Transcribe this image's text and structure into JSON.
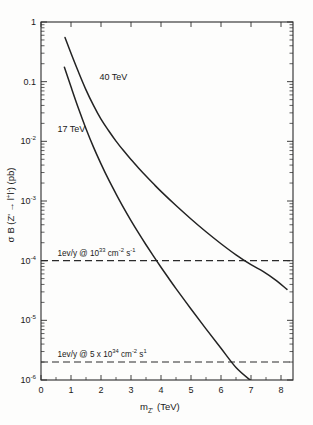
{
  "chart_data": {
    "type": "line",
    "title": "",
    "xlabel": "m_Z' (TeV)",
    "ylabel": "σ B (Z' → l⁺l⁻) (pb)",
    "xlabel_parts": {
      "main": "m",
      "sub": "Z'",
      "units": "(TeV)"
    },
    "ylabel_parts": {
      "sigma": "σ",
      "b": "B (Z'",
      "arrow": "→",
      "leptons": "l",
      "sup_plus": "+",
      "leptons2": "l",
      "sup_minus": "-",
      "close": ") (pb)"
    },
    "xlim": [
      0,
      8.4
    ],
    "ylim": [
      1e-06,
      1
    ],
    "yscale": "log",
    "xscale": "linear",
    "grid": false,
    "legend_position": "inline-annotations",
    "xticks": [
      0,
      1,
      2,
      3,
      4,
      5,
      6,
      7,
      8
    ],
    "xtick_labels": [
      "0",
      "1",
      "2",
      "3",
      "4",
      "5",
      "6",
      "7",
      "8"
    ],
    "yticks": [
      1,
      0.1,
      0.01,
      0.001,
      0.0001,
      1e-05,
      1e-06
    ],
    "ytick_labels": [
      "1",
      "0.1",
      "10⁻²",
      "10⁻³",
      "10⁻⁴",
      "10⁻⁵",
      "10⁻⁶"
    ],
    "ytick_label_parts": [
      {
        "base": "1",
        "exp": ""
      },
      {
        "base": "0.1",
        "exp": ""
      },
      {
        "base": "10",
        "exp": "-2"
      },
      {
        "base": "10",
        "exp": "-3"
      },
      {
        "base": "10",
        "exp": "-4"
      },
      {
        "base": "10",
        "exp": "-5"
      },
      {
        "base": "10",
        "exp": "-6"
      }
    ],
    "series": [
      {
        "name": "40 TeV",
        "label": "40 TeV",
        "label_x": 1.95,
        "label_y": 0.105,
        "points": [
          [
            0.8,
            0.55
          ],
          [
            1.0,
            0.3
          ],
          [
            1.25,
            0.145
          ],
          [
            1.5,
            0.073
          ],
          [
            1.75,
            0.04
          ],
          [
            2.0,
            0.0235
          ],
          [
            2.25,
            0.0152
          ],
          [
            2.5,
            0.0101
          ],
          [
            2.75,
            0.007
          ],
          [
            3.0,
            0.00495
          ],
          [
            3.25,
            0.00358
          ],
          [
            3.5,
            0.00262
          ],
          [
            3.75,
            0.00194
          ],
          [
            4.0,
            0.00145
          ],
          [
            4.5,
            0.00084
          ],
          [
            5.0,
            0.0005
          ],
          [
            5.5,
            0.000305
          ],
          [
            6.0,
            0.000192
          ],
          [
            6.5,
            0.000125
          ],
          [
            7.0,
            8.55e-05
          ],
          [
            7.4,
            6.6e-05
          ],
          [
            7.8,
            4.8e-05
          ],
          [
            8.2,
            3.3e-05
          ]
        ]
      },
      {
        "name": "17 TeV",
        "label": "17 TeV",
        "label_x": 0.55,
        "label_y": 0.0145,
        "points": [
          [
            0.78,
            0.175
          ],
          [
            1.0,
            0.082
          ],
          [
            1.25,
            0.0355
          ],
          [
            1.5,
            0.0163
          ],
          [
            1.75,
            0.008
          ],
          [
            2.0,
            0.0042
          ],
          [
            2.25,
            0.0023
          ],
          [
            2.5,
            0.00132
          ],
          [
            2.75,
            0.000775
          ],
          [
            3.0,
            0.00047
          ],
          [
            3.25,
            0.000292
          ],
          [
            3.5,
            0.000185
          ],
          [
            3.75,
            0.000119
          ],
          [
            4.0,
            7.75e-05
          ],
          [
            4.25,
            5.12e-05
          ],
          [
            4.5,
            3.4e-05
          ],
          [
            5.0,
            1.55e-05
          ],
          [
            5.5,
            7.2e-06
          ],
          [
            6.0,
            3.4e-06
          ],
          [
            6.5,
            1.62e-06
          ],
          [
            7.0,
            9.7e-07
          ]
        ]
      }
    ],
    "annotations": [
      {
        "name": "luminosity-1e33",
        "y_value": 0.0001,
        "text": "1ev/y @ 10³³ cm⁻² s⁻¹",
        "parts": {
          "prefix": "1ev/y @ 10",
          "exp1": "33",
          "mid": " cm",
          "exp2": "-2",
          "mid2": " s",
          "exp3": "-1"
        },
        "style": "dashed",
        "label_x": 0.55,
        "label_y_offset": -5
      },
      {
        "name": "luminosity-5e34",
        "y_value": 2e-06,
        "text": "1ev/y @ 5 x 10³⁴ cm⁻² s¹",
        "parts": {
          "prefix": "1ev/y @ 5 x 10",
          "exp1": "34",
          "mid": " cm",
          "exp2": "-2",
          "mid2": " s",
          "exp3": "1"
        },
        "style": "dashed",
        "label_x": 0.55,
        "label_y_offset": -5
      }
    ]
  },
  "colors": {
    "curve": "#232323",
    "axis": "#2b2b2b",
    "background": "#fdfdfc",
    "text": "#1a1a1a"
  }
}
